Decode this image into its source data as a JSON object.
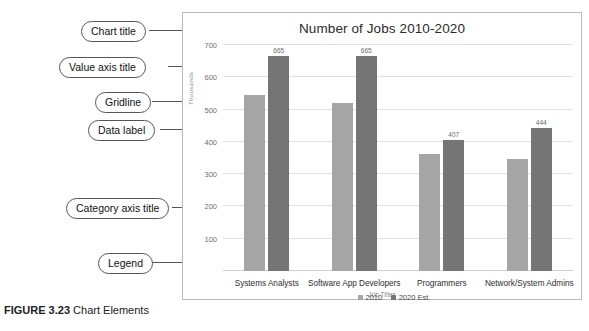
{
  "figure": {
    "number": "FIGURE 3.23",
    "caption": "Chart Elements"
  },
  "annotations": [
    {
      "id": "chart-title",
      "label": "Chart title"
    },
    {
      "id": "value-axis-title",
      "label": "Value axis title"
    },
    {
      "id": "gridline",
      "label": "Gridline"
    },
    {
      "id": "data-label",
      "label": "Data label"
    },
    {
      "id": "category-axis-title",
      "label": "Category axis title"
    },
    {
      "id": "legend",
      "label": "Legend"
    }
  ],
  "chart_data": {
    "type": "bar",
    "title": "Number of Jobs 2010-2020",
    "xlabel": "Job Titles",
    "ylabel": "Thousands",
    "ylim": [
      0,
      700
    ],
    "ytick_step": 100,
    "yticks": [
      100,
      200,
      300,
      400,
      500,
      600,
      700
    ],
    "grid": true,
    "legend_position": "bottom",
    "categories": [
      "Systems Analysts",
      "Software App Developers",
      "Programmers",
      "Network/System Admins"
    ],
    "series": [
      {
        "name": "2010",
        "color": "#a5a5a5",
        "values": [
          544,
          520,
          363,
          347
        ],
        "labels": [
          "",
          "",
          "",
          ""
        ]
      },
      {
        "name": "2020 Est.",
        "color": "#757575",
        "values": [
          665,
          665,
          407,
          444
        ],
        "labels": [
          "665",
          "665",
          "407",
          "444"
        ]
      }
    ]
  },
  "colors": {
    "series_2010": "#a5a5a5",
    "series_2020": "#757575",
    "gridline": "#e2e2e2",
    "frame_border": "#b9b9b9",
    "callout_border": "#555555"
  }
}
